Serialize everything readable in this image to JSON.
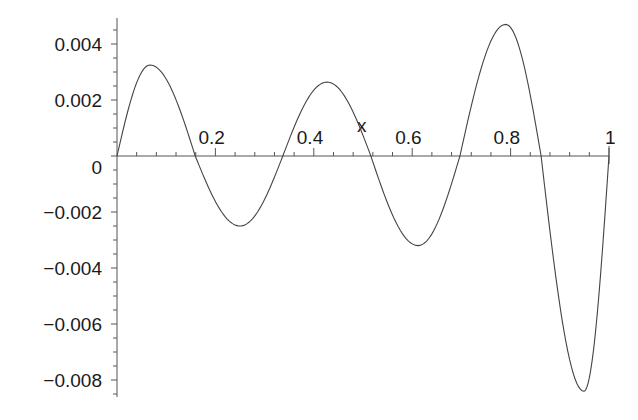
{
  "chart_data": {
    "type": "line",
    "title": "",
    "xlabel": "x",
    "ylabel": "",
    "xlim": [
      0,
      1
    ],
    "ylim": [
      -0.0086,
      0.0049
    ],
    "grid": false,
    "legend": null,
    "x_ticks": [
      "0.2",
      "0.4",
      "0.6",
      "0.8",
      "1"
    ],
    "y_ticks": [
      "0.004",
      "0.002",
      "0",
      "−0.002",
      "−0.004",
      "−0.006",
      "−0.008"
    ],
    "series": [
      {
        "name": "f(x)",
        "x": [
          0,
          0.067,
          0.159,
          0.25,
          0.337,
          0.427,
          0.516,
          0.612,
          0.697,
          0.79,
          0.862,
          0.949,
          1.0
        ],
        "y": [
          0,
          0.00325,
          0,
          -0.0025,
          0,
          0.00264,
          0,
          -0.0032,
          0,
          0.0047,
          0,
          -0.0084,
          0
        ]
      }
    ]
  },
  "axes": {
    "x_axis_label": "x",
    "origin_label": "0"
  }
}
